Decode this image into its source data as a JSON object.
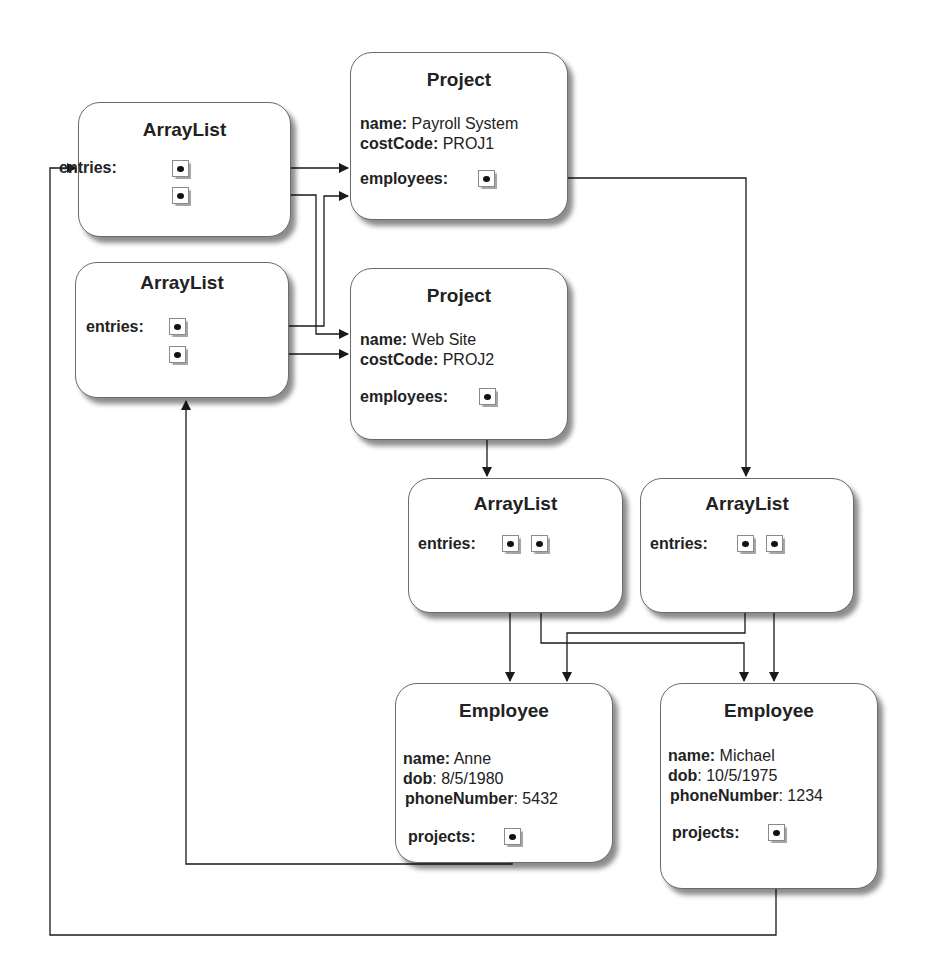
{
  "diagram": {
    "type": "object-reference-diagram",
    "colors": {
      "line": "#1a1a1a",
      "box_border": "#6a6a6a",
      "background": "#ffffff"
    },
    "nodes": {
      "arraylist_a": {
        "class": "ArrayList",
        "entries_label": "entries:"
      },
      "arraylist_b": {
        "class": "ArrayList",
        "entries_label": "entries:"
      },
      "project_1": {
        "class": "Project",
        "name_label": "name:",
        "name_value": "Payroll System",
        "costcode_label": "costCode:",
        "costcode_value": "PROJ1",
        "employees_label": "employees:"
      },
      "project_2": {
        "class": "Project",
        "name_label": "name:",
        "name_value": "Web Site",
        "costcode_label": "costCode:",
        "costcode_value": "PROJ2",
        "employees_label": "employees:"
      },
      "arraylist_c": {
        "class": "ArrayList",
        "entries_label": "entries:"
      },
      "arraylist_d": {
        "class": "ArrayList",
        "entries_label": "entries:"
      },
      "employee_anne": {
        "class": "Employee",
        "name_label": "name:",
        "name_value": "Anne",
        "dob_label": "dob",
        "dob_value": ": 8/5/1980",
        "phone_label": "phoneNumber",
        "phone_value": ": 5432",
        "projects_label": "projects:"
      },
      "employee_michael": {
        "class": "Employee",
        "name_label": "name:",
        "name_value": "Michael",
        "dob_label": "dob",
        "dob_value": ": 10/5/1975",
        "phone_label": "phoneNumber",
        "phone_value": ": 1234",
        "projects_label": "projects:"
      }
    },
    "edges": [
      {
        "from": "arraylist_a.entries[0]",
        "to": "project_1"
      },
      {
        "from": "arraylist_a.entries[1]",
        "to": "project_2"
      },
      {
        "from": "arraylist_b.entries[0]",
        "to": "project_1"
      },
      {
        "from": "arraylist_b.entries[1]",
        "to": "project_2"
      },
      {
        "from": "project_1.employees",
        "to": "arraylist_d"
      },
      {
        "from": "project_2.employees",
        "to": "arraylist_c"
      },
      {
        "from": "arraylist_c.entries[0]",
        "to": "employee_anne"
      },
      {
        "from": "arraylist_c.entries[1]",
        "to": "employee_michael"
      },
      {
        "from": "arraylist_d.entries[0]",
        "to": "employee_anne"
      },
      {
        "from": "arraylist_d.entries[1]",
        "to": "employee_michael"
      },
      {
        "from": "employee_anne.projects",
        "to": "arraylist_b"
      },
      {
        "from": "employee_michael.projects",
        "to": "arraylist_a"
      }
    ]
  }
}
